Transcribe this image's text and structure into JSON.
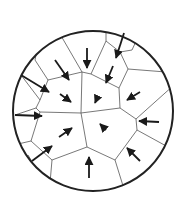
{
  "diagram": {
    "title": "Polygonal cells in a circle with inward arrows",
    "colors": {
      "background": "#ffffff",
      "circle": "#222222",
      "cell_edges": "#555555",
      "arrows": "#1a1a1a"
    },
    "circle": {
      "cx": 93,
      "cy": 111,
      "r": 80
    },
    "cell_edges": [
      [
        [
          60,
          34
        ],
        [
          82,
          72
        ]
      ],
      [
        [
          82,
          72
        ],
        [
          48,
          80
        ]
      ],
      [
        [
          48,
          80
        ],
        [
          35,
          60
        ]
      ],
      [
        [
          35,
          60
        ],
        [
          36,
          55
        ]
      ],
      [
        [
          48,
          80
        ],
        [
          40,
          100
        ]
      ],
      [
        [
          40,
          100
        ],
        [
          21,
          75
        ]
      ],
      [
        [
          40,
          100
        ],
        [
          36,
          108
        ]
      ],
      [
        [
          36,
          108
        ],
        [
          15,
          115
        ]
      ],
      [
        [
          36,
          108
        ],
        [
          40,
          112
        ]
      ],
      [
        [
          40,
          112
        ],
        [
          81,
          113
        ]
      ],
      [
        [
          81,
          113
        ],
        [
          82,
          72
        ]
      ],
      [
        [
          82,
          72
        ],
        [
          91,
          74
        ]
      ],
      [
        [
          91,
          74
        ],
        [
          106,
          41
        ]
      ],
      [
        [
          106,
          27
        ],
        [
          106,
          41
        ]
      ],
      [
        [
          106,
          41
        ],
        [
          120,
          52
        ]
      ],
      [
        [
          120,
          52
        ],
        [
          132,
          50
        ]
      ],
      [
        [
          132,
          50
        ],
        [
          137,
          39
        ]
      ],
      [
        [
          120,
          52
        ],
        [
          128,
          69
        ]
      ],
      [
        [
          128,
          69
        ],
        [
          166,
          72
        ]
      ],
      [
        [
          128,
          69
        ],
        [
          119,
          88
        ]
      ],
      [
        [
          91,
          74
        ],
        [
          119,
          88
        ]
      ],
      [
        [
          119,
          88
        ],
        [
          120,
          108
        ]
      ],
      [
        [
          120,
          108
        ],
        [
          81,
          113
        ]
      ],
      [
        [
          120,
          108
        ],
        [
          136,
          119
        ]
      ],
      [
        [
          136,
          119
        ],
        [
          174,
          85
        ]
      ],
      [
        [
          136,
          119
        ],
        [
          137,
          130
        ]
      ],
      [
        [
          137,
          130
        ],
        [
          168,
          147
        ]
      ],
      [
        [
          137,
          130
        ],
        [
          115,
          160
        ]
      ],
      [
        [
          81,
          113
        ],
        [
          87,
          147
        ]
      ],
      [
        [
          87,
          147
        ],
        [
          115,
          160
        ]
      ],
      [
        [
          40,
          112
        ],
        [
          31,
          141
        ]
      ],
      [
        [
          31,
          141
        ],
        [
          18,
          144
        ]
      ],
      [
        [
          31,
          141
        ],
        [
          52,
          160
        ]
      ],
      [
        [
          52,
          160
        ],
        [
          87,
          147
        ]
      ],
      [
        [
          52,
          160
        ],
        [
          50,
          183
        ]
      ],
      [
        [
          115,
          160
        ],
        [
          124,
          189
        ]
      ],
      [
        [
          28,
          155
        ],
        [
          34,
          165
        ]
      ]
    ],
    "arrows": [
      {
        "x1": 87,
        "y1": 48,
        "x2": 87,
        "y2": 68
      },
      {
        "x1": 124,
        "y1": 33,
        "x2": 116,
        "y2": 58
      },
      {
        "x1": 113,
        "y1": 66,
        "x2": 106,
        "y2": 83
      },
      {
        "x1": 55,
        "y1": 60,
        "x2": 69,
        "y2": 80
      },
      {
        "x1": 21,
        "y1": 75,
        "x2": 49,
        "y2": 92
      },
      {
        "x1": 60,
        "y1": 94,
        "x2": 71,
        "y2": 102
      },
      {
        "x1": 98,
        "y1": 96,
        "x2": 95,
        "y2": 103
      },
      {
        "x1": 140,
        "y1": 92,
        "x2": 127,
        "y2": 100
      },
      {
        "x1": 15,
        "y1": 115,
        "x2": 42,
        "y2": 116
      },
      {
        "x1": 159,
        "y1": 122,
        "x2": 139,
        "y2": 121
      },
      {
        "x1": 106,
        "y1": 130,
        "x2": 100,
        "y2": 124
      },
      {
        "x1": 59,
        "y1": 137,
        "x2": 72,
        "y2": 128
      },
      {
        "x1": 32,
        "y1": 161,
        "x2": 52,
        "y2": 146
      },
      {
        "x1": 89,
        "y1": 178,
        "x2": 89,
        "y2": 157
      },
      {
        "x1": 140,
        "y1": 161,
        "x2": 127,
        "y2": 148
      }
    ]
  }
}
